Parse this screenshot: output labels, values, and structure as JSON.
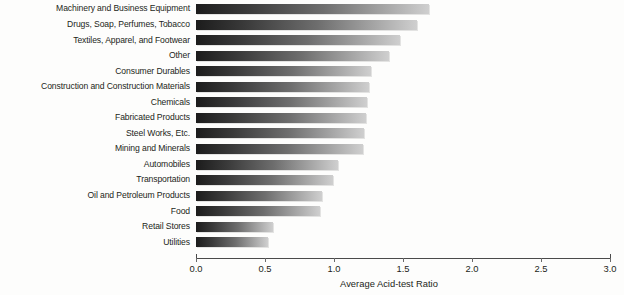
{
  "chart_data": {
    "type": "bar",
    "orientation": "horizontal",
    "title": "",
    "xlabel": "Average Acid-test Ratio",
    "ylabel": "",
    "xlim": [
      0.0,
      3.0
    ],
    "grid": false,
    "legend": null,
    "xticks": [
      "0.0",
      "0.5",
      "1.0",
      "1.5",
      "2.0",
      "2.5",
      "3.0"
    ],
    "xtick_values": [
      0.0,
      0.5,
      1.0,
      1.5,
      2.0,
      2.5,
      3.0
    ],
    "categories": [
      "Machinery and Business Equipment",
      "Drugs, Soap, Perfumes, Tobacco",
      "Textiles, Apparel, and Footwear",
      "Other",
      "Consumer Durables",
      "Construction and Construction Materials",
      "Chemicals",
      "Fabricated Products",
      "Steel Works, Etc.",
      "Mining and Minerals",
      "Automobiles",
      "Transportation",
      "Oil and Petroleum Products",
      "Food",
      "Retail Stores",
      "Utilities"
    ],
    "values": [
      1.69,
      1.6,
      1.48,
      1.4,
      1.27,
      1.25,
      1.24,
      1.23,
      1.22,
      1.21,
      1.03,
      0.99,
      0.91,
      0.9,
      0.56,
      0.52
    ],
    "bar_gradient": {
      "from": "#1c1c1c",
      "to": "#cfcfcf"
    },
    "background_color": "#fdfdfc",
    "axis_color": "#4a4a4a",
    "text_color": "#231f20"
  }
}
